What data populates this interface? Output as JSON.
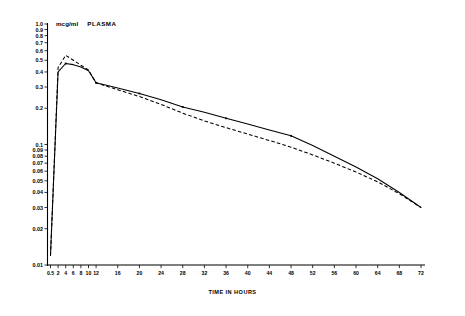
{
  "labels": {
    "unit": "mcg/ml",
    "panel": "PLASMA",
    "xaxis_title": "TIME IN HOURS"
  },
  "chart_data": {
    "type": "line",
    "title": "",
    "subtitle": "",
    "xlabel": "TIME IN HOURS",
    "ylabel": "mcg/ml PLASMA",
    "yscale": "log",
    "xscale": "linear-segmented",
    "grid": false,
    "legend": "none",
    "xlim": [
      0.5,
      72
    ],
    "ylim": [
      0.01,
      1.0
    ],
    "x_ticks": [
      0.5,
      2,
      4,
      6,
      8,
      10,
      12,
      16,
      20,
      24,
      28,
      32,
      36,
      40,
      44,
      48,
      52,
      56,
      60,
      64,
      68,
      72
    ],
    "x_tick_labels": [
      "0.5",
      "2",
      "4",
      "6",
      "8",
      "10",
      "12",
      "16",
      "20",
      "24",
      "28",
      "32",
      "36",
      "40",
      "44",
      "48",
      "52",
      "56",
      "60",
      "64",
      "68",
      "72"
    ],
    "y_ticks": [
      1.0,
      0.9,
      0.8,
      0.7,
      0.6,
      0.5,
      0.4,
      0.3,
      0.2,
      0.1,
      0.09,
      0.08,
      0.07,
      0.06,
      0.05,
      0.04,
      0.03,
      0.02,
      0.01
    ],
    "y_tick_labels": [
      "1.0",
      "0.9",
      "0.8",
      "0.7",
      "0.6",
      "0.5",
      "0.4",
      "0.3",
      "0.2",
      "0.1",
      "0.09",
      "0.08",
      "0.07",
      "0.06",
      "0.05",
      "0.04",
      "0.03",
      "0.02",
      "0.01"
    ],
    "series": [
      {
        "name": "solid-curve",
        "style": "solid",
        "x": [
          0.5,
          2,
          4,
          6,
          8,
          10,
          12,
          16,
          20,
          24,
          28,
          32,
          36,
          40,
          44,
          48,
          52,
          56,
          60,
          64,
          68,
          72
        ],
        "y": [
          0.012,
          0.4,
          0.47,
          0.46,
          0.44,
          0.41,
          0.325,
          0.295,
          0.265,
          0.235,
          0.205,
          0.185,
          0.165,
          0.148,
          0.132,
          0.118,
          0.098,
          0.08,
          0.065,
          0.052,
          0.04,
          0.03
        ]
      },
      {
        "name": "dashed-curve",
        "style": "dashed",
        "x": [
          0.5,
          2,
          4,
          6,
          8,
          10,
          12,
          16,
          20,
          24,
          28,
          32,
          36,
          40,
          44,
          48,
          52,
          56,
          60,
          64,
          68,
          72
        ],
        "y": [
          0.012,
          0.435,
          0.55,
          0.5,
          0.455,
          0.415,
          0.325,
          0.285,
          0.25,
          0.215,
          0.182,
          0.157,
          0.138,
          0.122,
          0.108,
          0.095,
          0.082,
          0.07,
          0.059,
          0.049,
          0.039,
          0.03
        ]
      }
    ]
  }
}
